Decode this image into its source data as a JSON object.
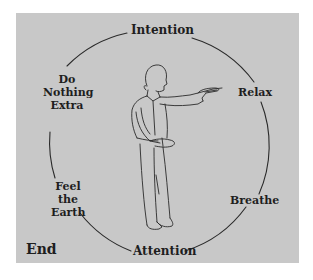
{
  "diagram": {
    "panel_color": "#c8c8c8",
    "stroke_color": "#2a2a2a",
    "cycle_labels": {
      "top": "Intention",
      "right_upper": "Relax",
      "right_lower": "Breathe",
      "bottom": "Attention",
      "left_lower": [
        "Feel",
        "the",
        "Earth"
      ],
      "left_upper": [
        "Do",
        "Nothing",
        "Extra"
      ]
    },
    "corner_label": "End",
    "figure": "standing-person-arm-extended"
  }
}
